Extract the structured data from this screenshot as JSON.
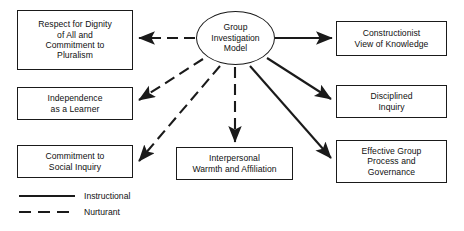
{
  "diagram": {
    "center_node": {
      "name": "group-investigation-model",
      "label": "Group\nInvestigation\nModel"
    },
    "nodes": [
      {
        "id": "respect-for-dignity",
        "label": "Respect for Dignity\nof All and\nCommitment to\nPluralism",
        "arrow_type": "Nurturant",
        "side": "left"
      },
      {
        "id": "independence-as-a-learner",
        "label": "Independence\nas a Learner",
        "arrow_type": "Nurturant",
        "side": "left"
      },
      {
        "id": "commitment-to-social-inquiry",
        "label": "Commitment to\nSocial Inquiry",
        "arrow_type": "Nurturant",
        "side": "left"
      },
      {
        "id": "interpersonal-warmth",
        "label": "Interpersonal\nWarmth and Affiliation",
        "arrow_type": "Nurturant",
        "side": "bottom"
      },
      {
        "id": "constructionist-view",
        "label": "Constructionist\nView of Knowledge",
        "arrow_type": "Instructional",
        "side": "right"
      },
      {
        "id": "disciplined-inquiry",
        "label": "Disciplined\nInquiry",
        "arrow_type": "Instructional",
        "side": "right"
      },
      {
        "id": "effective-group-process",
        "label": "Effective Group\nProcess and\nGovernance",
        "arrow_type": "Instructional",
        "side": "right"
      }
    ],
    "legend": {
      "items": [
        {
          "id": "instructional",
          "label": "Instructional",
          "style": "solid"
        },
        {
          "id": "nurturant",
          "label": "Nurturant",
          "style": "dashed"
        }
      ]
    },
    "colors": {
      "stroke": "#1a1a1a",
      "background": "#ffffff",
      "text": "#101010"
    }
  }
}
